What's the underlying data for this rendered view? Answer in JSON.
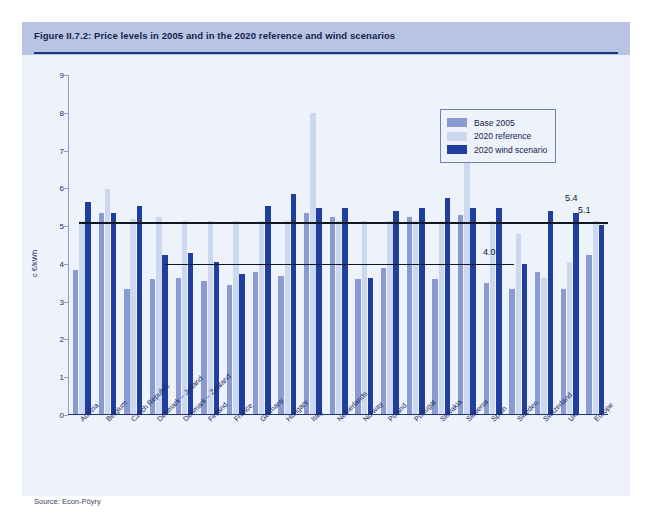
{
  "figure": {
    "title": "Figure II.7.2: Price levels in 2005 and in the 2020 reference and wind scenarios",
    "source": "Source: Econ-Pöyry"
  },
  "legend": {
    "position": "top-right",
    "items": [
      {
        "label": "Base 2005",
        "color": "#8a9bd2"
      },
      {
        "label": "2020 reference",
        "color": "#ccd7f0"
      },
      {
        "label": "2020 wind scenario",
        "color": "#1f3f9e"
      }
    ]
  },
  "chart_data": {
    "type": "bar",
    "title": "Price levels in 2005 and in the 2020 reference and wind scenarios",
    "xlabel": "",
    "ylabel": "c €/kWh",
    "ylim": [
      0,
      9
    ],
    "yticks": [
      "0",
      "1",
      "2",
      "3",
      "4",
      "5",
      "6",
      "7",
      "8",
      "9"
    ],
    "grid": false,
    "categories": [
      "Austria",
      "Belgium",
      "Czech Republic",
      "Denmark – Jutland",
      "Denmark – Zealand",
      "Finland",
      "France",
      "Germany",
      "Hungary",
      "Italy",
      "Netherlands",
      "Norway",
      "Poland",
      "Portugal",
      "Slovakia",
      "Slovenia",
      "Spain",
      "Sweden",
      "Switzerland",
      "UK",
      "Europe"
    ],
    "series": [
      {
        "name": "Base 2005",
        "color": "#8a9bd2",
        "values": [
          3.8,
          5.3,
          3.3,
          3.55,
          3.6,
          3.5,
          3.4,
          3.75,
          3.65,
          5.3,
          5.2,
          3.55,
          3.85,
          5.2,
          3.55,
          5.25,
          3.45,
          3.3,
          3.75,
          3.3,
          4.2
        ]
      },
      {
        "name": "2020 reference",
        "color": "#ccd7f0",
        "values": [
          5.1,
          5.95,
          5.15,
          5.2,
          5.1,
          5.1,
          5.1,
          5.1,
          5.1,
          7.95,
          5.1,
          5.1,
          5.1,
          5.1,
          5.1,
          7.45,
          5.1,
          4.75,
          3.6,
          4.0,
          5.1
        ]
      },
      {
        "name": "2020 wind scenario",
        "color": "#1f3f9e",
        "values": [
          5.6,
          5.3,
          5.5,
          4.2,
          4.25,
          4.0,
          3.7,
          5.5,
          5.8,
          5.45,
          5.45,
          3.6,
          5.35,
          5.45,
          5.7,
          5.45,
          5.45,
          3.95,
          5.35,
          5.3,
          5.0
        ]
      }
    ],
    "reference_lines": [
      {
        "value": 5.1,
        "label": "5.1",
        "from_index": 0,
        "to_index": 20
      },
      {
        "value": 5.4,
        "label": "5.4",
        "from_index": 0,
        "to_index": 0
      },
      {
        "value": 4.0,
        "label": "4.0",
        "from_index": 3,
        "to_index": 15
      }
    ],
    "annotations": [
      {
        "text": "5.4",
        "value": 5.4
      },
      {
        "text": "5.1",
        "value": 5.1
      },
      {
        "text": "4.0",
        "value": 4.0
      }
    ]
  }
}
